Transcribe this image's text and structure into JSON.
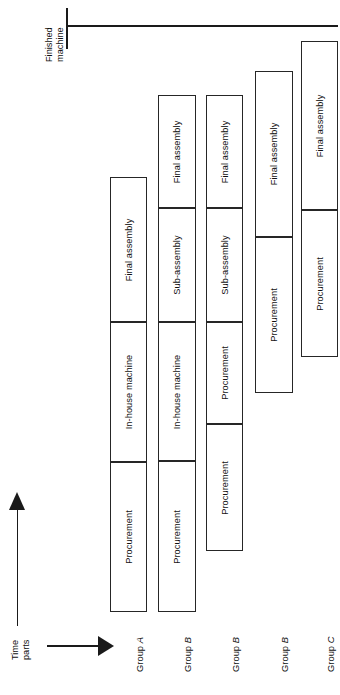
{
  "diagram": {
    "title_top": {
      "line1": "Finished",
      "line2": "machine"
    },
    "axis_time": {
      "line1": "Time",
      "line2": "parts"
    },
    "arrow_time_name": "time-axis-arrow",
    "arrow_parts_name": "parts-axis-arrow"
  },
  "columns": [
    {
      "group_prefix": "Group ",
      "group_letter": "A",
      "x": 110,
      "width": 37,
      "segments": [
        {
          "label": "Final assembly",
          "top": 177,
          "height": 145
        },
        {
          "label": "In-house machine",
          "top": 322,
          "height": 140
        },
        {
          "label": "Procurement",
          "top": 462,
          "height": 150
        }
      ]
    },
    {
      "group_prefix": "Group ",
      "group_letter": "B",
      "x": 158,
      "width": 38,
      "segments": [
        {
          "label": "Final assembly",
          "top": 95,
          "height": 113
        },
        {
          "label": "Sub-assembly",
          "top": 208,
          "height": 114
        },
        {
          "label": "In-house machine",
          "top": 322,
          "height": 139
        },
        {
          "label": "Procurement",
          "top": 461,
          "height": 151
        }
      ]
    },
    {
      "group_prefix": "Group ",
      "group_letter": "B",
      "x": 206,
      "width": 37,
      "segments": [
        {
          "label": "Final assembly",
          "top": 95,
          "height": 113
        },
        {
          "label": "Sub-assembly",
          "top": 208,
          "height": 114
        },
        {
          "label": "Procurement",
          "top": 322,
          "height": 102
        },
        {
          "label": "Procurement",
          "top": 424,
          "height": 127
        }
      ]
    },
    {
      "group_prefix": "Group ",
      "group_letter": "B",
      "x": 255,
      "width": 38,
      "segments": [
        {
          "label": "Final assembly",
          "top": 71,
          "height": 166
        },
        {
          "label": "Procurement",
          "top": 237,
          "height": 156
        }
      ]
    },
    {
      "group_prefix": "Group ",
      "group_letter": "C",
      "x": 301,
      "width": 37,
      "segments": [
        {
          "label": "Final assembly",
          "top": 41,
          "height": 169
        },
        {
          "label": "Procurement",
          "top": 210,
          "height": 147
        }
      ]
    }
  ],
  "group_label_baseline_y": 672
}
